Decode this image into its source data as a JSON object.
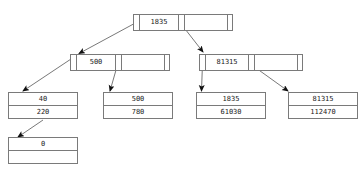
{
  "diagram": {
    "accent_color": "#7a7a7a",
    "text_color": "#1a1a1a",
    "background": "#ffffff"
  },
  "root": {
    "name": "root-node",
    "cells": [
      {
        "kind": "pointer",
        "label": ""
      },
      {
        "kind": "key",
        "label": "1835"
      },
      {
        "kind": "pointer",
        "label": ""
      },
      {
        "kind": "blank",
        "label": ""
      },
      {
        "kind": "tail",
        "label": ""
      }
    ]
  },
  "inner_left": {
    "name": "inner-node-left",
    "cells": [
      {
        "kind": "pointer",
        "label": ""
      },
      {
        "kind": "key",
        "label": "500"
      },
      {
        "kind": "pointer",
        "label": ""
      },
      {
        "kind": "blank",
        "label": ""
      },
      {
        "kind": "tail",
        "label": ""
      }
    ]
  },
  "inner_right": {
    "name": "inner-node-right",
    "cells": [
      {
        "kind": "pointer",
        "label": ""
      },
      {
        "kind": "key",
        "label": "81315"
      },
      {
        "kind": "pointer",
        "label": ""
      },
      {
        "kind": "blank",
        "label": ""
      },
      {
        "kind": "tail",
        "label": ""
      }
    ]
  },
  "leaves": [
    {
      "name": "leaf-node-1",
      "rows": [
        "40",
        "220"
      ]
    },
    {
      "name": "leaf-node-2",
      "rows": [
        "500",
        "780"
      ]
    },
    {
      "name": "leaf-node-3",
      "rows": [
        "1835",
        "61030"
      ]
    },
    {
      "name": "leaf-node-4",
      "rows": [
        "81315",
        "112470"
      ]
    }
  ],
  "overflow_leaf": {
    "name": "leaf-node-overflow",
    "rows": [
      "0",
      ""
    ]
  },
  "edges": [
    {
      "name": "edge-root-to-inner-left",
      "from": "root.pointer.0",
      "to": "inner_left.pointer.0"
    },
    {
      "name": "edge-root-to-inner-right",
      "from": "root.pointer.1",
      "to": "inner_right.pointer.0"
    },
    {
      "name": "edge-inner-left-to-leaf-1",
      "from": "inner_left.pointer.0",
      "to": "leaf-node-1"
    },
    {
      "name": "edge-inner-left-to-leaf-2",
      "from": "inner_left.pointer.1",
      "to": "leaf-node-2"
    },
    {
      "name": "edge-inner-right-to-leaf-3",
      "from": "inner_right.pointer.0",
      "to": "leaf-node-3"
    },
    {
      "name": "edge-inner-right-to-leaf-4",
      "from": "inner_right.pointer.1",
      "to": "leaf-node-4"
    },
    {
      "name": "edge-leaf-1-to-overflow",
      "from": "leaf-node-1",
      "to": "leaf-node-overflow"
    }
  ]
}
